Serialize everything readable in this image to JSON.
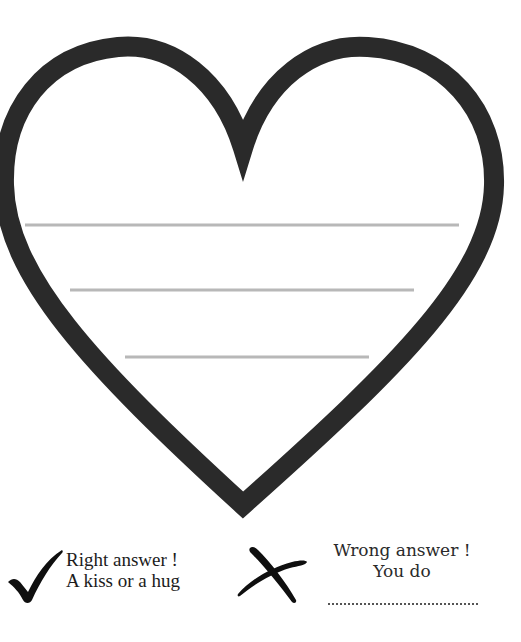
{
  "worksheet": {
    "heart": {
      "icon": "heart-outline-icon",
      "stroke_color": "#2a2a2a",
      "writing_lines_count": 3,
      "line_color": "#b8b8b8"
    },
    "legend": {
      "right": {
        "icon": "checkmark-icon",
        "line1": "Right answer !",
        "line2": "A kiss or a hug"
      },
      "wrong": {
        "icon": "cross-icon",
        "line1": "Wrong answer !",
        "line2": "You do",
        "blank": "................................"
      }
    }
  }
}
